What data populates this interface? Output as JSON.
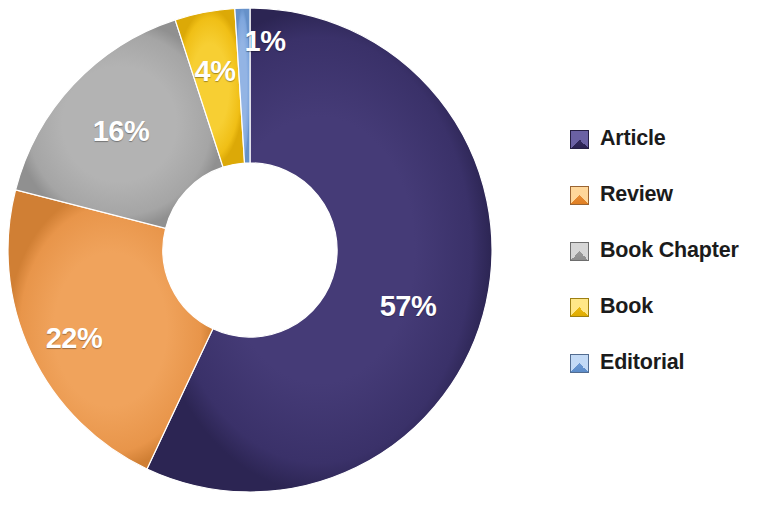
{
  "background_color": "#ffffff",
  "chart_data": {
    "type": "pie",
    "variant": "doughnut",
    "title": "",
    "subtitle": "",
    "xlabel": "",
    "ylabel": "",
    "grid": false,
    "legend_position": "right",
    "value_unit": "percent",
    "data_labels_shown": true,
    "data_label_color": "#ffffff",
    "hole_ratio": 0.36,
    "start_angle_deg": -90,
    "direction": "clockwise",
    "categories": [
      "Article",
      "Review",
      "Book Chapter",
      "Book",
      "Editorial"
    ],
    "values": [
      57,
      22,
      16,
      4,
      1
    ],
    "labels": [
      "57%",
      "22%",
      "16%",
      "4%",
      "1%"
    ],
    "colors": [
      "#3a3169",
      "#ed9a4d",
      "#a8a8a8",
      "#f2c31c",
      "#7ea6dd"
    ],
    "slices": [
      {
        "name": "Article",
        "value": 57,
        "label": "57%",
        "color": "#3a3169",
        "label_x": 408,
        "label_y": 306
      },
      {
        "name": "Review",
        "value": 22,
        "label": "22%",
        "color": "#ed9a4d",
        "label_x": 74,
        "label_y": 338
      },
      {
        "name": "Book Chapter",
        "value": 16,
        "label": "16%",
        "color": "#a8a8a8",
        "label_x": 121,
        "label_y": 131
      },
      {
        "name": "Book",
        "value": 4,
        "label": "4%",
        "color": "#f2c31c",
        "label_x": 215,
        "label_y": 71
      },
      {
        "name": "Editorial",
        "value": 1,
        "label": "1%",
        "color": "#7ea6dd",
        "label_x": 265,
        "label_y": 41
      }
    ]
  },
  "legend": {
    "items": [
      {
        "label": "Article",
        "color": "#3a3169",
        "swatch_light": "#6a61a4",
        "swatch_dark": "#2a2252"
      },
      {
        "label": "Review",
        "color": "#ed9a4d",
        "swatch_light": "#ffd79a",
        "swatch_dark": "#e07f22"
      },
      {
        "label": "Book Chapter",
        "color": "#a8a8a8",
        "swatch_light": "#d6d6d6",
        "swatch_dark": "#8d8d8d"
      },
      {
        "label": "Book",
        "color": "#f2c31c",
        "swatch_light": "#ffe787",
        "swatch_dark": "#e0ac00"
      },
      {
        "label": "Editorial",
        "color": "#7ea6dd",
        "swatch_light": "#c3daf6",
        "swatch_dark": "#5c8cc9"
      }
    ]
  }
}
